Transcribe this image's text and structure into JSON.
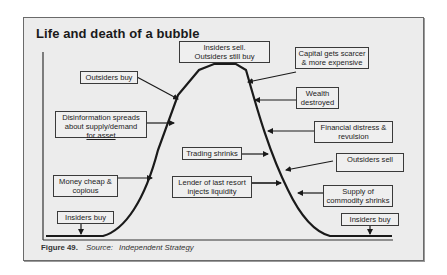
{
  "title": "Life and death of a bubble",
  "caption": {
    "figure": "Figure 49.",
    "source_label": "Source:",
    "source": "Independent Strategy"
  },
  "colors": {
    "background": "#ececec",
    "frame_border": "#6a6a6a",
    "curve": "#1a1a1a",
    "label_border": "#3a3a3a"
  },
  "labels": {
    "insiders_sell": [
      "Insiders sell.",
      "Outsiders still buy"
    ],
    "outsiders_buy": [
      "Outsiders buy"
    ],
    "disinformation": [
      "Disinformation spreads",
      "about supply/demand",
      "for asset"
    ],
    "money_cheap": [
      "Money cheap &",
      "copious"
    ],
    "insiders_buy_left": [
      "Insiders buy"
    ],
    "capital_scarcer": [
      "Capital gets scarcer",
      "& more expensive"
    ],
    "wealth_destroyed": [
      "Wealth",
      "destroyed"
    ],
    "financial_distress": [
      "Financial distress &",
      "revulsion"
    ],
    "trading_shrinks": [
      "Trading shrinks"
    ],
    "lender_last_resort": [
      "Lender of last resort",
      "injects liquidity"
    ],
    "outsiders_sell": [
      "Outsiders sell"
    ],
    "supply_shrinks": [
      "Supply of",
      "commodity shrinks"
    ],
    "insiders_buy_right": [
      "Insiders buy"
    ]
  }
}
